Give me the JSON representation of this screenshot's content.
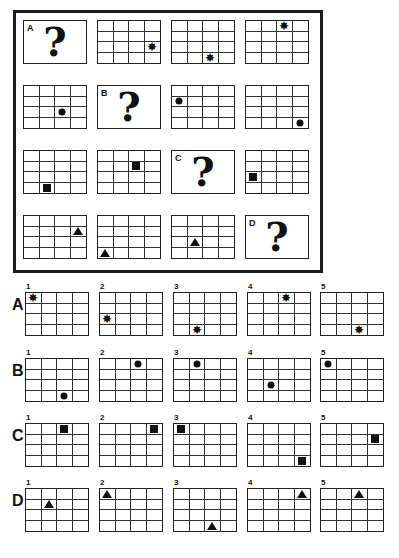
{
  "puzzle": {
    "grid_size": {
      "cols": 4,
      "rows": 4
    },
    "cells": [
      {
        "type": "question",
        "label": "A",
        "mark": "?"
      },
      {
        "type": "grid",
        "shape": "star",
        "col": 3,
        "row": 2
      },
      {
        "type": "grid",
        "shape": "star",
        "col": 2,
        "row": 3
      },
      {
        "type": "grid",
        "shape": "star",
        "col": 2,
        "row": 0
      },
      {
        "type": "grid",
        "shape": "dot",
        "col": 2,
        "row": 2
      },
      {
        "type": "question",
        "label": "B",
        "mark": "?"
      },
      {
        "type": "grid",
        "shape": "dot",
        "col": 0,
        "row": 1
      },
      {
        "type": "grid",
        "shape": "dot",
        "col": 3,
        "row": 3
      },
      {
        "type": "grid",
        "shape": "square",
        "col": 1,
        "row": 3
      },
      {
        "type": "grid",
        "shape": "square",
        "col": 2,
        "row": 1
      },
      {
        "type": "question",
        "label": "C",
        "mark": "?"
      },
      {
        "type": "grid",
        "shape": "square",
        "col": 0,
        "row": 2
      },
      {
        "type": "grid",
        "shape": "triangle",
        "col": 3,
        "row": 1
      },
      {
        "type": "grid",
        "shape": "triangle",
        "col": 0,
        "row": 3
      },
      {
        "type": "grid",
        "shape": "triangle",
        "col": 1,
        "row": 2
      },
      {
        "type": "question",
        "label": "D",
        "mark": "?"
      }
    ]
  },
  "answers": [
    {
      "label": "A",
      "shape": "star",
      "options": [
        {
          "num": "1",
          "col": 0,
          "row": 0
        },
        {
          "num": "2",
          "col": 0,
          "row": 2
        },
        {
          "num": "3",
          "col": 1,
          "row": 3
        },
        {
          "num": "4",
          "col": 2,
          "row": 0
        },
        {
          "num": "5",
          "col": 2,
          "row": 3
        }
      ]
    },
    {
      "label": "B",
      "shape": "dot",
      "options": [
        {
          "num": "1",
          "col": 2,
          "row": 3
        },
        {
          "num": "2",
          "col": 2,
          "row": 0
        },
        {
          "num": "3",
          "col": 1,
          "row": 0
        },
        {
          "num": "4",
          "col": 1,
          "row": 2
        },
        {
          "num": "5",
          "col": 0,
          "row": 0
        }
      ]
    },
    {
      "label": "C",
      "shape": "square",
      "options": [
        {
          "num": "1",
          "col": 2,
          "row": 0
        },
        {
          "num": "2",
          "col": 3,
          "row": 0
        },
        {
          "num": "3",
          "col": 0,
          "row": 0
        },
        {
          "num": "4",
          "col": 3,
          "row": 3
        },
        {
          "num": "5",
          "col": 3,
          "row": 1
        }
      ]
    },
    {
      "label": "D",
      "shape": "triangle",
      "options": [
        {
          "num": "1",
          "col": 1,
          "row": 1
        },
        {
          "num": "2",
          "col": 0,
          "row": 0
        },
        {
          "num": "3",
          "col": 2,
          "row": 3
        },
        {
          "num": "4",
          "col": 3,
          "row": 0
        },
        {
          "num": "5",
          "col": 2,
          "row": 0
        }
      ]
    }
  ],
  "icons": {
    "star": "✸",
    "dot": "dot-icon",
    "square": "square-icon",
    "triangle": "triangle-icon"
  },
  "colors": {
    "ink": "#111111",
    "background": "#ffffff"
  }
}
